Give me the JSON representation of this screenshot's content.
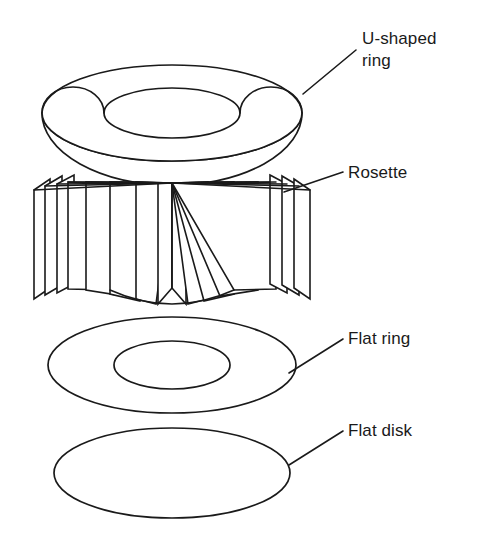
{
  "figure": {
    "background_color": "#ffffff",
    "line_color": "#1a1a1a",
    "canvas": {
      "width": 483,
      "height": 551
    }
  },
  "labels": [
    {
      "id": "u-shaped-ring",
      "line1": "U-shaped",
      "line2": "ring",
      "text_x": 362,
      "text_y": 44,
      "leader": "M 356 50 L 303 94"
    },
    {
      "id": "rosette",
      "line1": "Rosette",
      "line2": "",
      "text_x": 348,
      "text_y": 178,
      "leader": "M 343 172 L 284 192"
    },
    {
      "id": "flat-ring",
      "line1": "Flat ring",
      "line2": "",
      "text_x": 348,
      "text_y": 344,
      "leader": "M 343 339 L 289 373"
    },
    {
      "id": "flat-disk",
      "line1": "Flat disk",
      "line2": "",
      "text_x": 348,
      "text_y": 436,
      "leader": "M 343 431 L 289 465"
    }
  ],
  "components": {
    "u_shaped_ring": {
      "name": "U-shaped ring",
      "type": "torus",
      "outer_cx": 172,
      "outer_cy": 113,
      "outer_rx": 130,
      "outer_ry": 48,
      "inner_cx": 172,
      "inner_cy": 113,
      "inner_rx": 68,
      "inner_ry": 25,
      "bottom_bulge_ry": 72
    },
    "rosette": {
      "name": "Rosette",
      "type": "radial-pleated-fan",
      "apex_x": 172,
      "apex_y": 183,
      "panel_count": 12,
      "top_y": 176,
      "bottom_y": 305
    },
    "flat_ring": {
      "name": "Flat ring",
      "type": "annulus",
      "outer_cx": 172,
      "outer_cy": 365,
      "outer_rx": 124,
      "outer_ry": 48,
      "inner_cx": 172,
      "inner_cy": 365,
      "inner_rx": 58,
      "inner_ry": 24
    },
    "flat_disk": {
      "name": "Flat disk",
      "type": "disk",
      "cx": 172,
      "cy": 473,
      "rx": 118,
      "ry": 45
    }
  }
}
